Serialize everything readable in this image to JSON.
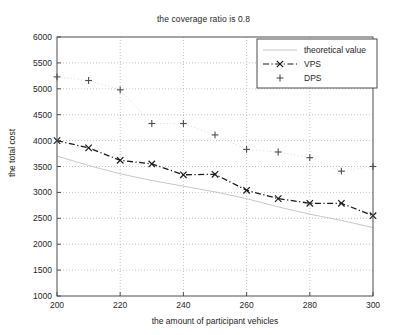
{
  "chart_data": {
    "type": "line",
    "title": "the coverage ratio is 0.8",
    "xlabel": "the amount of participant vehicles",
    "ylabel": "the total cost",
    "xlim": [
      200,
      300
    ],
    "ylim": [
      1000,
      6000
    ],
    "xticks": [
      200,
      220,
      240,
      260,
      280,
      300
    ],
    "yticks": [
      1000,
      1500,
      2000,
      2500,
      3000,
      3500,
      4000,
      4500,
      5000,
      5500,
      6000
    ],
    "grid": true,
    "legend_position": "top-right",
    "x": [
      200,
      210,
      220,
      230,
      240,
      250,
      260,
      270,
      280,
      290,
      300
    ],
    "series": [
      {
        "name": "theoretical value",
        "style": "solid-light",
        "marker": "none",
        "color": "#c8c8c8",
        "values": [
          3700,
          3520,
          3360,
          3230,
          3120,
          3010,
          2880,
          2720,
          2580,
          2460,
          2320
        ]
      },
      {
        "name": "VPS",
        "style": "dash-dot",
        "marker": "x",
        "color": "#1a1a1a",
        "values": [
          4000,
          3860,
          3620,
          3550,
          3340,
          3350,
          3040,
          2880,
          2790,
          2790,
          2550
        ]
      },
      {
        "name": "DPS",
        "style": "dotted-faint",
        "marker": "plus",
        "color": "#4d4d4d",
        "values": [
          5230,
          5160,
          4980,
          4330,
          4330,
          4110,
          3830,
          3780,
          3670,
          3410,
          3500
        ]
      }
    ]
  },
  "chart": {
    "title": "the coverage ratio is 0.8",
    "xlabel": "the amount of participant vehicles",
    "ylabel": "the total cost",
    "xtick_labels": [
      "200",
      "220",
      "240",
      "260",
      "280",
      "300"
    ],
    "ytick_labels": [
      "1000",
      "1500",
      "2000",
      "2500",
      "3000",
      "3500",
      "4000",
      "4500",
      "5000",
      "5500",
      "6000"
    ],
    "legend": [
      {
        "label": "theoretical value",
        "marker": "line"
      },
      {
        "label": "VPS",
        "marker": "dash-x"
      },
      {
        "label": "DPS",
        "marker": "plus"
      }
    ]
  }
}
